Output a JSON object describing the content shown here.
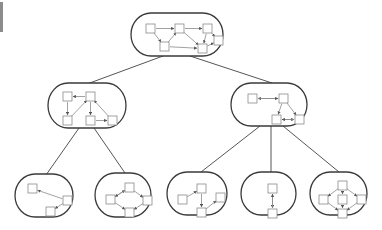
{
  "diagram": {
    "type": "hierarchical-graph-tree",
    "colors": {
      "container_stroke": "#3a3a3a",
      "tree_edge": "#555555",
      "box_stroke": "#8a8a8a",
      "arrow": "#8a8a8a",
      "arrow_head": "#555555",
      "background": "#ffffff"
    },
    "containers": [
      {
        "id": "root",
        "x": 131,
        "y": 13,
        "w": 92,
        "h": 43,
        "boxes": [
          [
            146,
            24
          ],
          [
            175,
            24
          ],
          [
            203,
            24
          ],
          [
            214,
            36
          ],
          [
            160,
            42
          ],
          [
            198,
            44
          ]
        ],
        "edges": [
          [
            0,
            1
          ],
          [
            1,
            2
          ],
          [
            0,
            4
          ],
          [
            4,
            1
          ],
          [
            1,
            5
          ],
          [
            2,
            5
          ],
          [
            4,
            5
          ],
          [
            2,
            3
          ],
          [
            5,
            3
          ]
        ]
      },
      {
        "id": "mid-left",
        "x": 48,
        "y": 83,
        "w": 78,
        "h": 45,
        "boxes": [
          [
            63,
            92
          ],
          [
            86,
            92
          ],
          [
            63,
            116
          ],
          [
            86,
            116
          ],
          [
            108,
            116
          ]
        ],
        "edges": [
          [
            1,
            0
          ],
          [
            0,
            2
          ],
          [
            2,
            1
          ],
          [
            1,
            3
          ],
          [
            3,
            4
          ],
          [
            4,
            1
          ]
        ]
      },
      {
        "id": "mid-right",
        "x": 231,
        "y": 83,
        "w": 76,
        "h": 43,
        "boxes": [
          [
            248,
            94
          ],
          [
            279,
            94
          ],
          [
            272,
            115
          ],
          [
            295,
            115
          ]
        ],
        "edges": [
          [
            1,
            0
          ],
          [
            0,
            1
          ],
          [
            1,
            2
          ],
          [
            1,
            3
          ],
          [
            2,
            3
          ],
          [
            3,
            2
          ]
        ]
      },
      {
        "id": "leaf-1",
        "x": 15,
        "y": 174,
        "w": 58,
        "h": 43,
        "boxes": [
          [
            28,
            184
          ],
          [
            63,
            196
          ],
          [
            46,
            207
          ]
        ],
        "edges": [
          [
            1,
            0
          ],
          [
            1,
            2
          ]
        ]
      },
      {
        "id": "leaf-2",
        "x": 95,
        "y": 173,
        "w": 56,
        "h": 44,
        "boxes": [
          [
            106,
            195
          ],
          [
            125,
            183
          ],
          [
            143,
            196
          ],
          [
            125,
            208
          ]
        ],
        "edges": [
          [
            0,
            1
          ],
          [
            1,
            0
          ],
          [
            1,
            2
          ],
          [
            2,
            3
          ],
          [
            0,
            3
          ]
        ]
      },
      {
        "id": "leaf-3",
        "x": 167,
        "y": 172,
        "w": 60,
        "h": 43,
        "boxes": [
          [
            178,
            195
          ],
          [
            197,
            184
          ],
          [
            197,
            208
          ],
          [
            216,
            193
          ]
        ],
        "edges": [
          [
            0,
            1
          ],
          [
            1,
            2
          ],
          [
            2,
            3
          ]
        ]
      },
      {
        "id": "leaf-4",
        "x": 241,
        "y": 172,
        "w": 55,
        "h": 43,
        "boxes": [
          [
            268,
            184
          ],
          [
            268,
            209
          ]
        ],
        "edges": [
          [
            0,
            1
          ],
          [
            1,
            0
          ]
        ]
      },
      {
        "id": "leaf-5",
        "x": 310,
        "y": 172,
        "w": 57,
        "h": 43,
        "boxes": [
          [
            338,
            181
          ],
          [
            319,
            195
          ],
          [
            338,
            195
          ],
          [
            357,
            195
          ],
          [
            338,
            209
          ]
        ],
        "edges": [
          [
            0,
            1
          ],
          [
            0,
            2
          ],
          [
            0,
            3
          ],
          [
            1,
            4
          ],
          [
            2,
            4
          ],
          [
            3,
            4
          ]
        ]
      }
    ],
    "tree_edges": [
      {
        "from": "root",
        "to": "mid-left",
        "x1": 163,
        "y1": 56,
        "x2": 87,
        "y2": 84
      },
      {
        "from": "root",
        "to": "mid-right",
        "x1": 190,
        "y1": 56,
        "x2": 272,
        "y2": 83
      },
      {
        "from": "mid-left",
        "to": "leaf-1",
        "x1": 79,
        "y1": 128,
        "x2": 46,
        "y2": 175
      },
      {
        "from": "mid-left",
        "to": "leaf-2",
        "x1": 94,
        "y1": 128,
        "x2": 125,
        "y2": 173
      },
      {
        "from": "mid-right",
        "to": "leaf-3",
        "x1": 260,
        "y1": 126,
        "x2": 201,
        "y2": 172
      },
      {
        "from": "mid-right",
        "to": "leaf-4",
        "x1": 271,
        "y1": 126,
        "x2": 271,
        "y2": 172
      },
      {
        "from": "mid-right",
        "to": "leaf-5",
        "x1": 283,
        "y1": 126,
        "x2": 339,
        "y2": 172
      }
    ],
    "box_size": 9
  }
}
